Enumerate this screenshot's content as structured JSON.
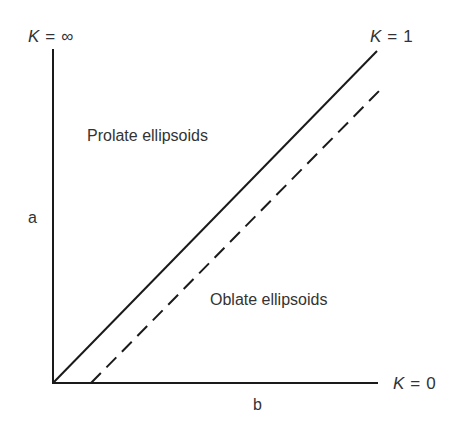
{
  "diagram": {
    "type": "ellipsoid-shape-diagram",
    "axes": {
      "x_label": "b",
      "y_label": "a",
      "origin": [
        53,
        383
      ],
      "x_end": [
        378,
        383
      ],
      "y_top": [
        53,
        49
      ]
    },
    "boundary_labels": {
      "top_left": {
        "var": "K",
        "eq": "=",
        "value": "∞"
      },
      "top_right": {
        "var": "K",
        "eq": "=",
        "value": "1"
      },
      "bottom_right": {
        "var": "K",
        "eq": "=",
        "value": "0"
      }
    },
    "regions": {
      "upper": "Prolate ellipsoids",
      "lower": "Oblate ellipsoids"
    },
    "lines": [
      {
        "name": "K=1 line",
        "style": "solid",
        "from": [
          53,
          383
        ],
        "to": [
          377,
          51
        ]
      },
      {
        "name": "offset line",
        "style": "dashed",
        "from": [
          91,
          383
        ],
        "to": [
          380,
          90
        ]
      }
    ],
    "colors": {
      "line": "#1a1a1a",
      "text": "#333333",
      "background": "#ffffff"
    }
  }
}
